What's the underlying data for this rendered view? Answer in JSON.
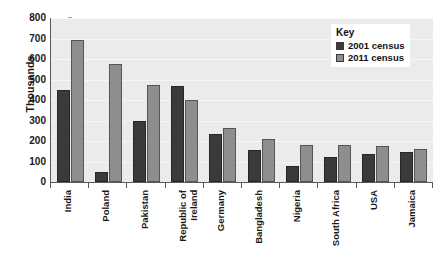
{
  "chart_data": {
    "type": "bar",
    "title": "",
    "subtitle": "",
    "xlabel": "",
    "ylabel": "Thousands",
    "ylim": [
      0,
      800
    ],
    "ytick_step": 100,
    "yticks": [
      0,
      100,
      200,
      300,
      400,
      500,
      600,
      700,
      800
    ],
    "grid": true,
    "legend_position": "top-right",
    "categories": [
      "India",
      "Poland",
      "Pakistan",
      "Republic of\nIreland",
      "Germany",
      "Bangladesh",
      "Nigeria",
      "South Africa",
      "USA",
      "Jamaica"
    ],
    "series": [
      {
        "name": "2001 census",
        "color": "#3a3a3a",
        "values": [
          450,
          50,
          300,
          470,
          235,
          155,
          80,
          120,
          135,
          145
        ]
      },
      {
        "name": "2011 census",
        "color": "#8e8e8e",
        "values": [
          695,
          575,
          475,
          400,
          265,
          210,
          180,
          180,
          175,
          160
        ]
      }
    ]
  },
  "legend": {
    "title": "Key",
    "items": [
      {
        "label": "2001 census",
        "color": "#3a3a3a"
      },
      {
        "label": "2011 census",
        "color": "#8e8e8e"
      }
    ]
  },
  "axes": {
    "y_title": "Thousands"
  },
  "colors": {
    "series_2001": "#3a3a3a",
    "series_2011": "#8e8e8e",
    "plot_background": "#ebebeb",
    "axis_line": "#5a5a5a",
    "text": "#1a1a1a"
  }
}
